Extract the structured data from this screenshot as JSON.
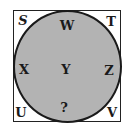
{
  "diagram": {
    "corners": {
      "top_left": "S",
      "top_right": "T",
      "bottom_left": "U",
      "bottom_right": "V"
    },
    "circle": {
      "top": "W",
      "left": "X",
      "center": "Y",
      "right": "Z",
      "bottom": "?"
    },
    "colors": {
      "circle_fill": "#b3b3b3",
      "stroke": "#1a1a1a",
      "background": "#ffffff"
    }
  }
}
